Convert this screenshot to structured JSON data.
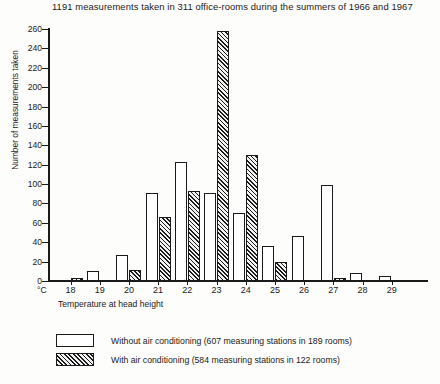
{
  "chart_data": {
    "type": "bar",
    "title": "1191 measurements taken in 311 office-rooms during the summers of 1966 and 1967",
    "xlabel": "Temperature at head height",
    "ylabel": "Number of measurements taken",
    "x_unit": "°C",
    "categories": [
      "18",
      "19",
      "20",
      "21",
      "22",
      "23",
      "24",
      "25",
      "26",
      "27",
      "28",
      "29"
    ],
    "series": [
      {
        "name": "Without air conditioning",
        "legend": "Without air conditioning  (607 measuring stations in 189 rooms)",
        "style": "plain",
        "values": [
          0,
          10,
          27,
          91,
          123,
          91,
          70,
          36,
          46,
          99,
          8,
          5
        ]
      },
      {
        "name": "With air conditioning",
        "legend": "With air conditioning  (584 measuring stations in 122 rooms)",
        "style": "hatched",
        "values": [
          3,
          0,
          11,
          66,
          93,
          258,
          130,
          20,
          0,
          3,
          0,
          0
        ]
      }
    ],
    "ylim": [
      0,
      260
    ],
    "yticks": [
      0,
      20,
      40,
      60,
      80,
      100,
      120,
      140,
      160,
      180,
      200,
      220,
      240,
      260
    ],
    "ytick_labels": [
      "0",
      "20",
      "40",
      "60",
      "80",
      "100",
      "120",
      "140",
      "160",
      "180",
      "200",
      "220",
      "240",
      "260"
    ],
    "grid": false,
    "legend_position": "below-plot"
  },
  "colors": {
    "ink": "#1a1a1a",
    "background": "#fdfdfb",
    "bar_plain_fill": "#ffffff",
    "bar_hatch_fill": "#f2f2f2"
  }
}
